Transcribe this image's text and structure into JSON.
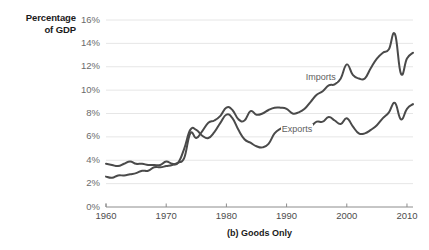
{
  "chart_data": {
    "type": "line",
    "title": "",
    "caption": "(b) Goods Only",
    "ylabel_line1": "Percentage",
    "ylabel_line2": "of GDP",
    "xlabel": "",
    "ylabel": "Percentage of GDP",
    "xlim": [
      1960,
      2011
    ],
    "ylim": [
      0,
      16
    ],
    "ytick_labels": [
      "16%",
      "14%",
      "12%",
      "10%",
      "8%",
      "6%",
      "4%",
      "2%",
      "0%"
    ],
    "ytick_values": [
      16,
      14,
      12,
      10,
      8,
      6,
      4,
      2,
      0
    ],
    "xtick_labels": [
      "1960",
      "1970",
      "1980",
      "1990",
      "2000",
      "2010"
    ],
    "xtick_values": [
      1960,
      1970,
      1980,
      1990,
      2000,
      2010
    ],
    "grid": true,
    "legend_position": "inline-annotation",
    "line_color": "#4a4a4a",
    "grid_color": "#e6e6e6",
    "axis_color": "#8c8c8c",
    "x": [
      1960,
      1961,
      1962,
      1963,
      1964,
      1965,
      1966,
      1967,
      1968,
      1969,
      1970,
      1971,
      1972,
      1973,
      1974,
      1975,
      1976,
      1977,
      1978,
      1979,
      1980,
      1981,
      1982,
      1983,
      1984,
      1985,
      1986,
      1987,
      1988,
      1989,
      1990,
      1991,
      1992,
      1993,
      1994,
      1995,
      1996,
      1997,
      1998,
      1999,
      2000,
      2001,
      2002,
      2003,
      2004,
      2005,
      2006,
      2007,
      2008,
      2009,
      2010,
      2011
    ],
    "series": [
      {
        "name": "Imports",
        "label": "Imports",
        "label_x": 2000,
        "label_y": 11.0,
        "values": [
          2.6,
          2.5,
          2.7,
          2.7,
          2.8,
          2.9,
          3.1,
          3.1,
          3.4,
          3.4,
          3.5,
          3.6,
          3.8,
          4.2,
          6.3,
          5.9,
          6.5,
          7.2,
          7.4,
          7.8,
          8.5,
          8.3,
          7.5,
          7.4,
          8.2,
          7.9,
          8.0,
          8.3,
          8.5,
          8.5,
          8.4,
          8.0,
          8.1,
          8.4,
          9.0,
          9.6,
          9.9,
          10.4,
          10.5,
          11.0,
          12.2,
          11.3,
          11.0,
          11.0,
          11.9,
          12.7,
          13.2,
          13.5,
          14.8,
          11.4,
          12.7,
          13.2
        ]
      },
      {
        "name": "Exports",
        "label": "Exports",
        "label_x": 1996,
        "label_y": 6.6,
        "values": [
          3.7,
          3.6,
          3.5,
          3.7,
          3.9,
          3.7,
          3.7,
          3.6,
          3.6,
          3.6,
          3.9,
          3.7,
          3.8,
          5.0,
          6.6,
          6.6,
          6.1,
          5.9,
          6.4,
          7.2,
          7.9,
          7.6,
          6.6,
          5.8,
          5.5,
          5.2,
          5.1,
          5.4,
          6.3,
          6.7,
          6.9,
          7.0,
          6.9,
          6.8,
          6.9,
          7.3,
          7.3,
          7.7,
          7.4,
          7.1,
          7.6,
          6.9,
          6.3,
          6.3,
          6.6,
          7.0,
          7.6,
          8.1,
          8.9,
          7.5,
          8.4,
          8.8
        ]
      }
    ]
  }
}
